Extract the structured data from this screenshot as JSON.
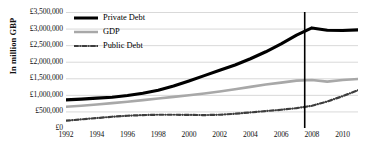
{
  "chart_data": {
    "type": "line",
    "title": "",
    "xlabel": "",
    "ylabel": "In million GBP",
    "xlim": [
      1992,
      2011
    ],
    "ylim": [
      0,
      3500000
    ],
    "grid": true,
    "legend_position": "top-left",
    "x": [
      1992,
      1993,
      1994,
      1995,
      1996,
      1997,
      1998,
      1999,
      2000,
      2001,
      2002,
      2003,
      2004,
      2005,
      2006,
      2007,
      2008,
      2009,
      2010,
      2011
    ],
    "x_tick_labels": [
      "1992",
      "1994",
      "1996",
      "1998",
      "2000",
      "2002",
      "2004",
      "2006",
      "2008",
      "2010"
    ],
    "x_tick_values": [
      1992,
      1994,
      1996,
      1998,
      2000,
      2002,
      2004,
      2006,
      2008,
      2010
    ],
    "y_tick_labels": [
      "£0",
      "£500,000",
      "£1,000,000",
      "£1,500,000",
      "£2,000,000",
      "£2,500,000",
      "£3,000,000",
      "£3,500,000"
    ],
    "y_tick_values": [
      0,
      500000,
      1000000,
      1500000,
      2000000,
      2500000,
      3000000,
      3500000
    ],
    "series": [
      {
        "name": "Private Debt",
        "color": "#000000",
        "style": "solid",
        "width": 3.1,
        "values": [
          850000,
          870000,
          900000,
          930000,
          980000,
          1050000,
          1140000,
          1270000,
          1420000,
          1580000,
          1740000,
          1900000,
          2090000,
          2300000,
          2540000,
          2800000,
          3020000,
          2950000,
          2940000,
          2960000
        ]
      },
      {
        "name": "GDP",
        "color": "#a8a8a8",
        "style": "solid",
        "width": 2.6,
        "values": [
          640000,
          670000,
          710000,
          750000,
          790000,
          840000,
          890000,
          940000,
          990000,
          1040000,
          1100000,
          1170000,
          1240000,
          1310000,
          1370000,
          1430000,
          1450000,
          1400000,
          1450000,
          1480000
        ]
      },
      {
        "name": "Public Debt",
        "color": "#3d3d3d",
        "style": "dash-dot",
        "width": 2.2,
        "values": [
          220000,
          260000,
          300000,
          340000,
          370000,
          390000,
          400000,
          400000,
          395000,
          390000,
          400000,
          430000,
          470000,
          510000,
          550000,
          600000,
          670000,
          800000,
          960000,
          1140000
        ]
      }
    ],
    "annotations": [
      {
        "name": "crisis-marker",
        "type": "vertical-line",
        "x": 2007.5,
        "color": "#000000",
        "width": 1.6
      }
    ]
  },
  "legend": {
    "items": [
      {
        "label": "Private Debt",
        "key": "private-debt"
      },
      {
        "label": "GDP",
        "key": "gdp"
      },
      {
        "label": "Public Debt",
        "key": "public-debt"
      }
    ]
  },
  "axis": {
    "y_title": "In million GBP"
  },
  "style": {
    "grid_color": "#d9d9d9",
    "axis_color": "#808080",
    "background": "#ffffff"
  }
}
